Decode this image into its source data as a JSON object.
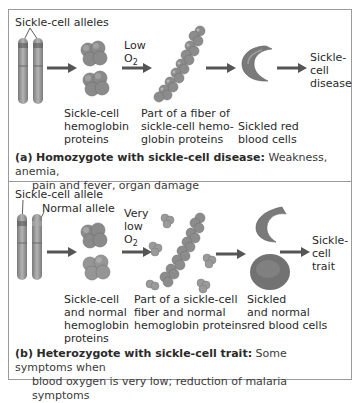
{
  "panel_a": {
    "allele_label": "Sickle-cell alleles",
    "condition_label": [
      "Low",
      "O",
      "2"
    ],
    "step_labels": {
      "hemoglobin": [
        "Sickle-cell",
        "hemoglobin",
        "proteins"
      ],
      "fiber": [
        "Part of a fiber of",
        "sickle-cell hemo-",
        "globin proteins"
      ],
      "cells": [
        "Sickled red",
        "blood cells"
      ],
      "outcome": [
        "Sickle-",
        "cell",
        "disease"
      ]
    },
    "caption": {
      "tag": "(a)",
      "title": "Homozygote with sickle-cell disease:",
      "text_line1": "Weakness, anemia,",
      "text_line2": "pain and fever, organ damage"
    }
  },
  "panel_b": {
    "allele_label_1": "Sickle-cell allele",
    "allele_label_2": "Normal allele",
    "condition_label": [
      "Very",
      "low",
      "O",
      "2"
    ],
    "step_labels": {
      "hemoglobin": [
        "Sickle-cell",
        "and normal",
        "hemoglobin",
        "proteins"
      ],
      "fiber": [
        "Part of a sickle-cell",
        "fiber and normal",
        "hemoglobin proteins"
      ],
      "cells": [
        "Sickled",
        "and normal",
        "red blood cells"
      ],
      "outcome": [
        "Sickle-",
        "cell",
        "trait"
      ]
    },
    "caption": {
      "tag": "(b)",
      "title": "Heterozygote with sickle-cell trait:",
      "text_line1": "Some symptoms when",
      "text_line2": "blood oxygen is very low; reduction of malaria symptoms"
    }
  },
  "colors": {
    "frame": "#9a9a9a",
    "arrow": "#555555",
    "chromosome": "#8c8c8c",
    "protein": "#8a8a8a",
    "cell": "#7a7a7a"
  }
}
